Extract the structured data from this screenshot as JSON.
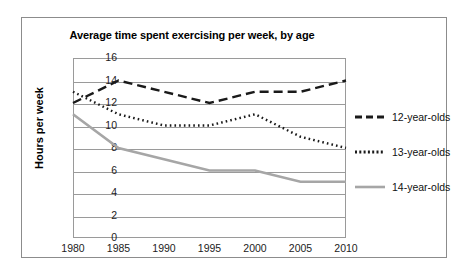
{
  "chart_data": {
    "type": "line",
    "title": "Average time spent exercising per week, by age",
    "xlabel": "",
    "ylabel": "Hours per week",
    "x": [
      1980,
      1985,
      1990,
      1995,
      2000,
      2005,
      2010
    ],
    "categories": [
      "1980",
      "1985",
      "1990",
      "1995",
      "2000",
      "2005",
      "2010"
    ],
    "xlim": [
      1980,
      2010
    ],
    "ylim": [
      0,
      16
    ],
    "yticks": [
      0,
      2,
      4,
      6,
      8,
      10,
      12,
      14,
      16
    ],
    "ytick_labels": [
      "0",
      "2",
      "4",
      "6",
      "8",
      "10",
      "12",
      "14",
      "16"
    ],
    "grid": true,
    "legend_position": "right",
    "series": [
      {
        "name": "12-year-olds",
        "values": [
          12,
          14,
          13,
          12,
          13,
          13,
          14
        ],
        "color": "#1a1a1a",
        "style": "dashed"
      },
      {
        "name": "13-year-olds",
        "values": [
          13,
          11,
          10,
          10,
          11,
          9,
          8
        ],
        "color": "#1a1a1a",
        "style": "dotted"
      },
      {
        "name": "14-year-olds",
        "values": [
          11,
          8,
          7,
          6,
          6,
          5,
          5
        ],
        "color": "#a6a6a6",
        "style": "solid"
      }
    ]
  },
  "legend": {
    "items": [
      {
        "label": "12-year-olds"
      },
      {
        "label": "13-year-olds"
      },
      {
        "label": "14-year-olds"
      }
    ]
  }
}
